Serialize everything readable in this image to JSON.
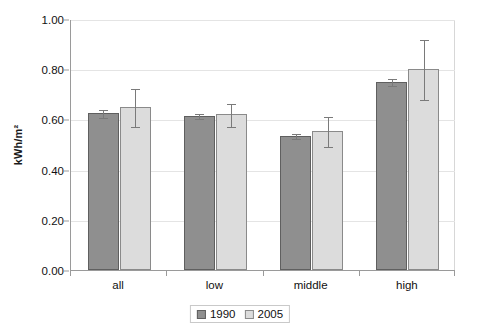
{
  "chart_data": {
    "type": "bar",
    "title": "",
    "xlabel": "",
    "ylabel": "kWh/m²",
    "categories": [
      "all",
      "low",
      "middle",
      "high"
    ],
    "ylim": [
      0.0,
      1.0
    ],
    "ytick_step": 0.2,
    "ytick_labels": [
      "0.00",
      "0.20",
      "0.40",
      "0.60",
      "0.80",
      "1.00"
    ],
    "ytick_values": [
      0.0,
      0.2,
      0.4,
      0.6,
      0.8,
      1.0
    ],
    "grid": true,
    "grid_axis": "y",
    "legend_position": "bottom",
    "series": [
      {
        "name": "1990",
        "color": "#8f8f8f",
        "values": [
          0.625,
          0.615,
          0.535,
          0.75
        ],
        "errors_low": [
          0.61,
          0.605,
          0.525,
          0.737
        ],
        "errors_high": [
          0.64,
          0.625,
          0.545,
          0.763
        ]
      },
      {
        "name": "2005",
        "color": "#dcdcdc",
        "values": [
          0.65,
          0.62,
          0.555,
          0.8
        ],
        "errors_low": [
          0.575,
          0.575,
          0.495,
          0.68
        ],
        "errors_high": [
          0.725,
          0.665,
          0.615,
          0.92
        ]
      }
    ]
  },
  "legend": {
    "items": [
      {
        "label": "1990",
        "swatch": "s1990"
      },
      {
        "label": "2005",
        "swatch": "s2005"
      }
    ]
  }
}
